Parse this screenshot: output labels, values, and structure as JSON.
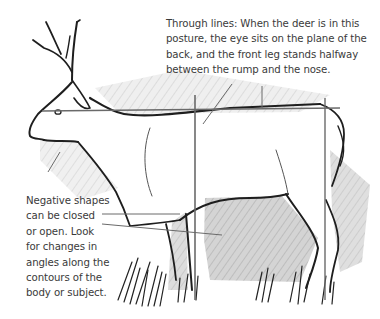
{
  "illustration": {
    "subject": "deer-sketch",
    "colors": {
      "ink": "#1e1e1e",
      "guide_line": "#6a6a6a",
      "shadow": "#c8c8c8",
      "text": "#3a3a3a",
      "background": "#ffffff"
    }
  },
  "captions": {
    "through_lines": {
      "lines": [
        "Through lines: When the deer is in this",
        "posture, the eye sits on the plane of the",
        "back, and the front leg stands halfway",
        "between the rump and the nose."
      ]
    },
    "negative_shapes": {
      "lines": [
        "Negative shapes",
        "can be closed",
        "or open. Look",
        "for changes in",
        "angles along the",
        "contours of the",
        "body or subject."
      ]
    }
  }
}
